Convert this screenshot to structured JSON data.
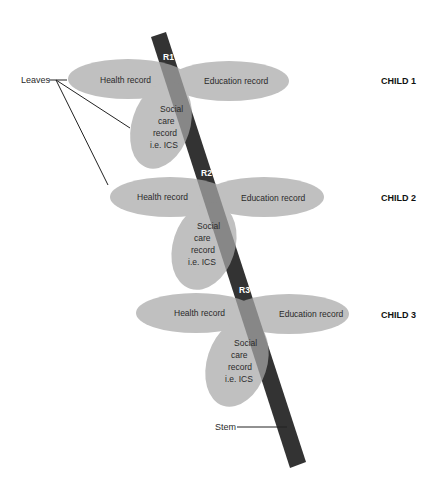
{
  "diagram": {
    "colors": {
      "stem": "#333333",
      "leaf": "#b8b8b8",
      "text": "#2a2a2a",
      "background": "#ffffff"
    },
    "stem": {
      "label": "Stem"
    },
    "leaves_label": "Leaves",
    "nodes": [
      {
        "node_label": "R1",
        "child_label": "CHILD 1",
        "health": "Health record",
        "education": "Education record",
        "social": [
          "Social",
          "care",
          "record",
          "i.e. ICS"
        ]
      },
      {
        "node_label": "R2",
        "child_label": "CHILD 2",
        "health": "Health record",
        "education": "Education record",
        "social": [
          "Social",
          "care",
          "record",
          "i.e. ICS"
        ]
      },
      {
        "node_label": "R3",
        "child_label": "CHILD 3",
        "health": "Health record",
        "education": "Education record",
        "social": [
          "Social",
          "care",
          "record",
          "i.e. ICS"
        ]
      }
    ]
  }
}
